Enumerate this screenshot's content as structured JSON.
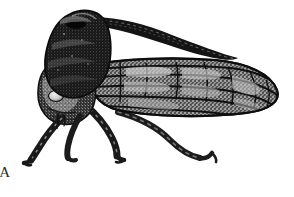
{
  "figure": {
    "label": "A",
    "caption_letter": "A",
    "illustration_style": "black-and-white stipple engraving",
    "background_color": "#ffffff",
    "ink_color": "#1a1a1a",
    "midtone_color": "#595959",
    "highlight_color": "#d8d8d8",
    "view": "lateral",
    "orientation": "head-left",
    "canvas": {
      "width": 294,
      "height": 197
    }
  },
  "anatomy": {
    "parts": [
      {
        "name": "pronotal-horn",
        "label": "pronotal horn",
        "description": "long tapering dorsal spine curving back over the wing",
        "tip_x": 238,
        "tip_y": 58,
        "base_x": 88,
        "base_y": 18
      },
      {
        "name": "pronotum",
        "label": "pronotum",
        "description": "dark stippled hood covering the thorax",
        "x": 55,
        "y": 10,
        "width": 60,
        "height": 70
      },
      {
        "name": "head",
        "label": "head",
        "description": "rounded anterior capsule below the pronotum",
        "x": 44,
        "y": 70,
        "width": 38,
        "height": 45
      },
      {
        "name": "compound-eye",
        "label": "compound eye",
        "description": "pale oval on the side of the head",
        "cx": 56,
        "cy": 96,
        "rx": 7,
        "ry": 5
      },
      {
        "name": "forewing",
        "label": "forewing",
        "description": "elongate veined tegmen with longitudinal veins and cross-veins",
        "x": 85,
        "y": 58,
        "width": 193,
        "height": 55,
        "vein_count": 6,
        "crossvein_count": 7
      },
      {
        "name": "foreleg",
        "label": "foreleg",
        "description": "front leg angled down and forward, tarsus at lower left",
        "tarsus_x": 27,
        "tarsus_y": 163
      },
      {
        "name": "midleg",
        "label": "midleg",
        "description": "middle leg angled down and back, tarsus at center left",
        "tarsus_x": 118,
        "tarsus_y": 161
      },
      {
        "name": "hindleg",
        "label": "hindleg",
        "description": "long posterior leg extending to the right, tarsus at lower right",
        "tarsus_x": 211,
        "tarsus_y": 160
      },
      {
        "name": "rostrum",
        "label": "rostrum",
        "description": "slender piercing mouthpart directed downward from the head",
        "x": 57,
        "y": 113,
        "length": 14
      }
    ]
  }
}
